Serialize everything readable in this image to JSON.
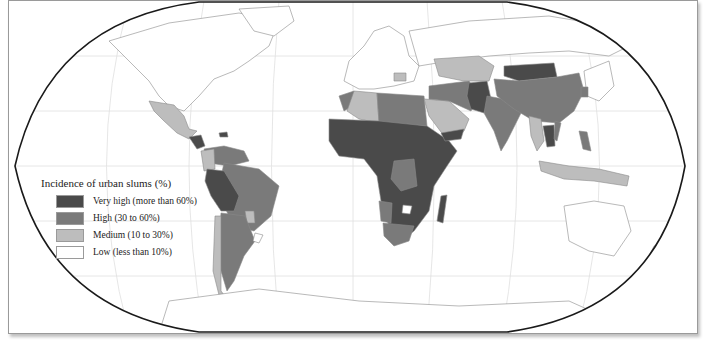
{
  "map": {
    "projection": "Robinson (world)",
    "colors": {
      "very_high": "#4a4a4a",
      "high": "#7a7a7a",
      "medium": "#bdbdbd",
      "low": "#ffffff",
      "border": "#9a9a9a",
      "graticule": "#dedede",
      "outline": "#1a1a1a"
    }
  },
  "legend": {
    "title": "Incidence of urban slums (%)",
    "items": [
      {
        "label": "Very high (more than 60%)",
        "color": "#4a4a4a"
      },
      {
        "label": "High (30 to 60%)",
        "color": "#7a7a7a"
      },
      {
        "label": "Medium (10 to 30%)",
        "color": "#bdbdbd"
      },
      {
        "label": "Low (less than 10%)",
        "color": "#ffffff"
      }
    ]
  }
}
